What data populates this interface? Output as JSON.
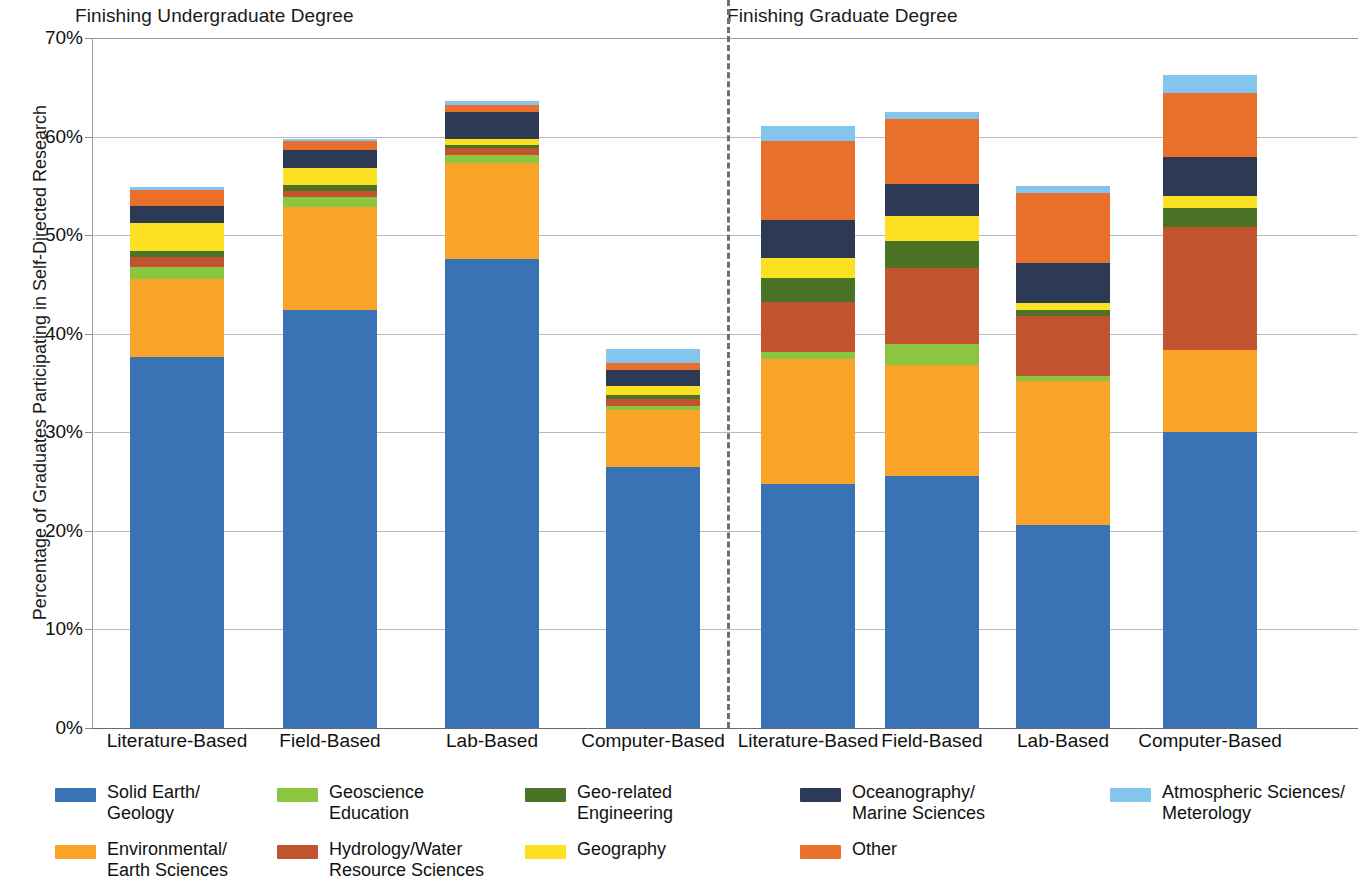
{
  "chart_data": {
    "type": "bar",
    "subtype": "stacked-bar",
    "title": "",
    "xlabel": "",
    "ylabel": "Percentage of Graduates Participating in Self-Directed Research",
    "ylim": [
      0,
      70
    ],
    "y_tick_labels": [
      "0%",
      "10%",
      "20%",
      "30%",
      "40%",
      "50%",
      "60%",
      "70%"
    ],
    "y_tick_values": [
      0,
      10,
      20,
      30,
      40,
      50,
      60,
      70
    ],
    "grid": true,
    "legend_position": "bottom",
    "group_titles": [
      "Finishing Undergraduate Degree",
      "Finishing Graduate Degree"
    ],
    "categories": [
      "Literature-Based",
      "Field-Based",
      "Lab-Based",
      "Computer-Based",
      "Literature-Based",
      "Field-Based",
      "Lab-Based",
      "Computer-Based"
    ],
    "series": [
      {
        "name": "Solid Earth/\nGeology",
        "color": "#3a72b6",
        "values": [
          37.6,
          42.4,
          47.6,
          26.5,
          24.8,
          25.6,
          20.6,
          30.0
        ]
      },
      {
        "name": "Environmental/\nEarth Sciences",
        "color": "#f7a428",
        "values": [
          8.0,
          10.5,
          9.7,
          5.8,
          12.6,
          11.2,
          14.6,
          8.4
        ]
      },
      {
        "name": "Geoscience\nEducation",
        "color": "#8cc63e",
        "values": [
          1.2,
          1.0,
          0.8,
          0.4,
          0.7,
          2.2,
          0.5,
          0.0
        ]
      },
      {
        "name": "Hydrology/Water\nResource Sciences",
        "color": "#c1542e",
        "values": [
          1.0,
          0.6,
          0.7,
          0.7,
          5.1,
          7.7,
          6.1,
          12.4
        ]
      },
      {
        "name": "Geo-related\nEngineering",
        "color": "#4a7326",
        "values": [
          0.6,
          0.6,
          0.3,
          0.4,
          2.5,
          2.7,
          0.6,
          2.0
        ]
      },
      {
        "name": "Geography",
        "color": "#fbe122",
        "values": [
          2.8,
          1.7,
          0.7,
          0.9,
          2.0,
          2.5,
          0.7,
          1.2
        ]
      },
      {
        "name": "Oceanography/\nMarine Sciences",
        "color": "#2d3a55",
        "values": [
          1.8,
          1.8,
          2.7,
          1.6,
          3.8,
          3.3,
          4.1,
          3.9
        ]
      },
      {
        "name": "Other",
        "color": "#e8702a",
        "values": [
          1.6,
          1.0,
          0.7,
          0.7,
          8.1,
          6.6,
          7.1,
          6.5
        ]
      },
      {
        "name": "Atmospheric Sciences/\nMeterology",
        "color": "#83c5ec",
        "values": [
          0.3,
          0.2,
          0.4,
          1.5,
          1.5,
          0.7,
          0.7,
          1.9
        ]
      }
    ]
  },
  "group_titles": {
    "undergraduate": "Finishing Undergraduate Degree",
    "graduate": "Finishing Graduate Degree"
  },
  "axes": {
    "y_title": "Percentage of Graduates Participating in Self-Directed Research",
    "y_ticks": [
      "70%",
      "60%",
      "50%",
      "40%",
      "30%",
      "20%",
      "10%",
      "0%"
    ],
    "x_labels": [
      "Literature-Based",
      "Field-Based",
      "Lab-Based",
      "Computer-Based",
      "Literature-Based",
      "Field-Based",
      "Lab-Based",
      "Computer-Based"
    ]
  },
  "legend": {
    "items": [
      {
        "label": "Solid Earth/\nGeology",
        "color": "#3a72b6"
      },
      {
        "label": "Geoscience\nEducation",
        "color": "#8cc63e"
      },
      {
        "label": "Geo-related\nEngineering",
        "color": "#4a7326"
      },
      {
        "label": "Oceanography/\nMarine Sciences",
        "color": "#2d3a55"
      },
      {
        "label": "Atmospheric Sciences/\nMeterology",
        "color": "#83c5ec"
      },
      {
        "label": "Environmental/\nEarth Sciences",
        "color": "#f7a428"
      },
      {
        "label": "Hydrology/Water\nResource Sciences",
        "color": "#c1542e"
      },
      {
        "label": "Geography",
        "color": "#fbe122"
      },
      {
        "label": "Other",
        "color": "#e8702a"
      }
    ]
  }
}
